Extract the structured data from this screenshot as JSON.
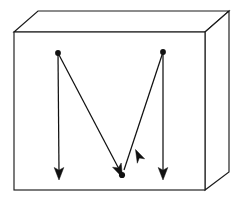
{
  "figure": {
    "title": "M-shaped directed stroke path inside a three-dimensional box",
    "background_color": "#ffffff",
    "line_color": "#111111",
    "edge_color": "#1a1a1a",
    "width": 243,
    "height": 207,
    "box": {
      "name": "rectangular-solid",
      "front_face": {
        "label": "front-face",
        "top_left": [
          14,
          32
        ],
        "top_right": [
          205,
          32
        ],
        "bottom_right": [
          205,
          190
        ],
        "bottom_left": [
          14,
          190
        ]
      },
      "top_face": {
        "label": "top-face",
        "back_left": [
          38,
          11
        ],
        "back_right": [
          229,
          11
        ]
      },
      "right_face": {
        "label": "right-face",
        "back_top": [
          229,
          11
        ],
        "back_bottom": [
          229,
          172
        ]
      }
    },
    "letterform": {
      "label": "M",
      "vertices": [
        {
          "name": "apex-left",
          "x": 58,
          "y": 53,
          "marker": "filled-dot"
        },
        {
          "name": "valley-center",
          "x": 122,
          "y": 175,
          "marker": "filled-dot"
        },
        {
          "name": "apex-right",
          "x": 163,
          "y": 52,
          "marker": "filled-dot"
        }
      ],
      "strokes": [
        {
          "name": "stroke-left-vertical",
          "from": [
            58,
            53
          ],
          "to": [
            59,
            176
          ],
          "arrow_at": "end",
          "arrow_direction": "down"
        },
        {
          "name": "stroke-left-diagonal",
          "from": [
            58,
            53
          ],
          "to": [
            122,
            175
          ],
          "arrow_at": "end",
          "arrow_direction": "down-right"
        },
        {
          "name": "stroke-right-diagonal",
          "from": [
            163,
            52
          ],
          "to": [
            122,
            175
          ],
          "arrow_at": "end",
          "arrow_direction": "down-left"
        },
        {
          "name": "stroke-right-vertical",
          "from": [
            163,
            52
          ],
          "to": [
            163,
            176
          ],
          "arrow_at": "end",
          "arrow_direction": "down"
        }
      ]
    }
  }
}
